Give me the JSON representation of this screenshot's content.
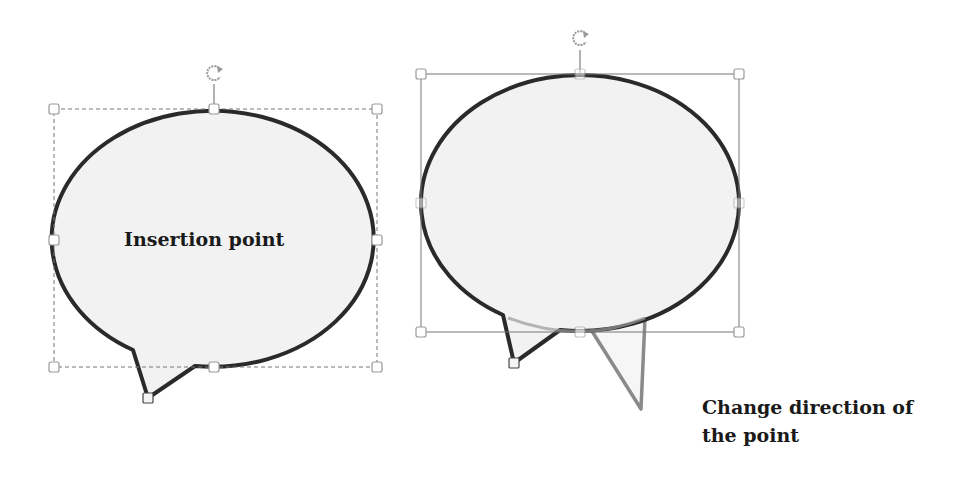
{
  "callouts": [
    {
      "id": "left",
      "label": "Insertion point",
      "state": "selected, dashed bounding box",
      "fill": "#f2f2f2",
      "stroke": "#2a2a2a"
    },
    {
      "id": "right",
      "label": "",
      "state": "selected, solid bounding box, pointer being dragged",
      "fill": "#f2f2f2",
      "stroke": "#2a2a2a",
      "ghost_pointer_stroke": "#8a8a8a"
    }
  ],
  "annotations": {
    "change_direction_line1": "Change direction of",
    "change_direction_line2": "the point"
  },
  "icons": {
    "rotate_handle": "rotate-icon",
    "resize_handle": "resize-handle"
  },
  "colors": {
    "background": "#ffffff",
    "outline": "#2a2a2a",
    "handle_stroke": "#9a9a9a",
    "ghost": "#8a8a8a"
  }
}
